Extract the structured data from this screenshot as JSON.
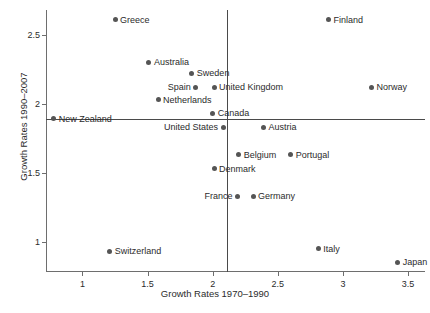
{
  "chart_data": {
    "type": "scatter",
    "title": "",
    "xlabel": "Growth Rates 1970–1990",
    "ylabel": "Growth Rates 1990–2007",
    "xlim": [
      0.72,
      3.63
    ],
    "ylim": [
      0.78,
      2.68
    ],
    "xticks": [
      1,
      1.5,
      2,
      2.5,
      3,
      3.5
    ],
    "xticklabels": [
      "1",
      "1.5",
      "2",
      "2.5",
      "3",
      "3.5"
    ],
    "yticks": [
      1,
      1.5,
      2,
      2.5
    ],
    "yticklabels": [
      "1",
      "1.5",
      "2",
      "2.5"
    ],
    "grid": false,
    "legend": false,
    "reference_lines": {
      "horizontal": 1.89,
      "vertical": 2.11,
      "color": "#4a4a4a"
    },
    "marker_color": "#555555",
    "points": [
      {
        "label": "Greece",
        "x": 1.25,
        "y": 2.61,
        "label_side": "right"
      },
      {
        "label": "Finland",
        "x": 2.89,
        "y": 2.61,
        "label_side": "right"
      },
      {
        "label": "Australia",
        "x": 1.51,
        "y": 2.3,
        "label_side": "right"
      },
      {
        "label": "Sweden",
        "x": 1.84,
        "y": 2.22,
        "label_side": "right"
      },
      {
        "label": "Spain",
        "x": 1.87,
        "y": 2.12,
        "label_side": "left"
      },
      {
        "label": "United Kingdom",
        "x": 2.01,
        "y": 2.12,
        "label_side": "right"
      },
      {
        "label": "Norway",
        "x": 3.22,
        "y": 2.12,
        "label_side": "right"
      },
      {
        "label": "Netherlands",
        "x": 1.58,
        "y": 2.03,
        "label_side": "right"
      },
      {
        "label": "Canada",
        "x": 2.0,
        "y": 1.93,
        "label_side": "right"
      },
      {
        "label": "New Zealand",
        "x": 0.78,
        "y": 1.89,
        "label_side": "right"
      },
      {
        "label": "United States",
        "x": 2.08,
        "y": 1.83,
        "label_side": "left"
      },
      {
        "label": "Austria",
        "x": 2.39,
        "y": 1.83,
        "label_side": "right"
      },
      {
        "label": "Belgium",
        "x": 2.2,
        "y": 1.63,
        "label_side": "right"
      },
      {
        "label": "Portugal",
        "x": 2.6,
        "y": 1.63,
        "label_side": "right"
      },
      {
        "label": "Denmark",
        "x": 2.01,
        "y": 1.53,
        "label_side": "right"
      },
      {
        "label": "France",
        "x": 2.19,
        "y": 1.33,
        "label_side": "left"
      },
      {
        "label": "Germany",
        "x": 2.31,
        "y": 1.33,
        "label_side": "right"
      },
      {
        "label": "Switzerland",
        "x": 1.21,
        "y": 0.93,
        "label_side": "right"
      },
      {
        "label": "Italy",
        "x": 2.81,
        "y": 0.95,
        "label_side": "right"
      },
      {
        "label": "Japan",
        "x": 3.42,
        "y": 0.85,
        "label_side": "right"
      }
    ]
  }
}
